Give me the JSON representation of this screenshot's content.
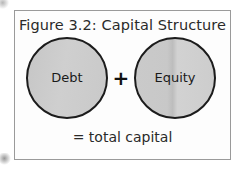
{
  "figure": {
    "title": "Figure 3.2: Capital Structure",
    "terms": [
      {
        "label": "Debt",
        "shape": "circle",
        "fill": "#cbcbcb",
        "stroke": "#1c1c1c"
      },
      {
        "label": "Equity",
        "shape": "circle",
        "fill": "#cbcbcb",
        "stroke": "#1c1c1c"
      }
    ],
    "operator": "+",
    "result": "= total capital",
    "frame": {
      "border_color": "#9a9a9a",
      "background": "#fdfdfd"
    },
    "page_background": "#ffffff",
    "text_color": "#2a2a2a"
  }
}
